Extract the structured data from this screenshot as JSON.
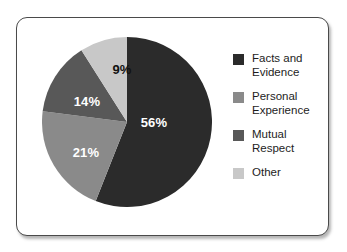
{
  "card": {
    "background": "#ffffff",
    "border_color": "#4a4a4a"
  },
  "chart_data": {
    "type": "pie",
    "title": "",
    "subtitle": "",
    "xlabel": "",
    "ylabel": "",
    "grid": false,
    "legend_position": "right",
    "total": 100,
    "unit": "%",
    "start_angle_deg": 0,
    "direction": "clockwise",
    "categories": [
      "Facts and Evidence",
      "Personal Experience",
      "Mutual Respect",
      "Other"
    ],
    "values": [
      56,
      21,
      14,
      9
    ],
    "colors": [
      "#2b2b2b",
      "#8a8a8a",
      "#585858",
      "#c8c8c8"
    ],
    "slices": [
      {
        "label": "Facts and Evidence",
        "legend_line1": "Facts and",
        "legend_line2": "Evidence",
        "value": 56,
        "data_label": "56%",
        "color": "#2b2b2b",
        "label_color": "#ffffff",
        "label_x": 112,
        "label_y": 87
      },
      {
        "label": "Personal Experience",
        "legend_line1": "Personal",
        "legend_line2": "Experience",
        "value": 21,
        "data_label": "21%",
        "color": "#8a8a8a",
        "label_color": "#ffffff",
        "label_x": 44,
        "label_y": 117
      },
      {
        "label": "Mutual Respect",
        "legend_line1": "Mutual",
        "legend_line2": "Respect",
        "value": 14,
        "data_label": "14%",
        "color": "#585858",
        "label_color": "#ffffff",
        "label_x": 45,
        "label_y": 66
      },
      {
        "label": "Other",
        "legend_line1": "Other",
        "legend_line2": "",
        "value": 9,
        "data_label": "9%",
        "color": "#c8c8c8",
        "label_color": "#111111",
        "label_x": 80,
        "label_y": 34
      }
    ]
  },
  "legend": {
    "items": [
      {
        "label": "Facts and\nEvidence",
        "color": "#2b2b2b"
      },
      {
        "label": "Personal\nExperience",
        "color": "#8a8a8a"
      },
      {
        "label": "Mutual\nRespect",
        "color": "#585858"
      },
      {
        "label": "Other",
        "color": "#c8c8c8"
      }
    ]
  }
}
